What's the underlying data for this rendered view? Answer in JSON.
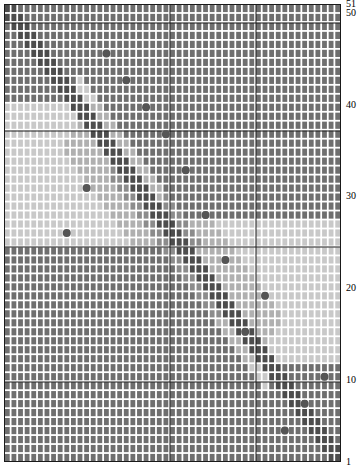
{
  "chart_data": {
    "type": "heatmap",
    "title": "",
    "xlabel": "",
    "ylabel": "",
    "n_rows": 51,
    "n_cols": 51,
    "xlim": [
      1,
      51
    ],
    "ylim": [
      1,
      51
    ],
    "grid": true,
    "legend": null,
    "axis_right": {
      "position": "right",
      "tick_labels": [
        "51",
        "50",
        "40",
        "30",
        "20",
        "10",
        "1"
      ],
      "tick_values": [
        51,
        50,
        40,
        30,
        20,
        10,
        1
      ]
    },
    "colors": {
      "dark": "#4d4d4d",
      "mid_dark": "#6f6f6f",
      "mid": "#8c8c8c",
      "mid_light": "#b0b0b0",
      "light": "#c9c9c9",
      "very_light": "#dcdcdc",
      "gridline": "#ffffff",
      "gridline_dark": "#bdbdbd",
      "marker": "#555555",
      "major_gridline": "#1a1a1a",
      "background": "#ffffff"
    },
    "major_gridlines": {
      "vertical_at_cols": [
        26,
        39
      ],
      "horizontal_at_rows": [
        10,
        25,
        38,
        50
      ]
    },
    "markers": {
      "shape": "circle",
      "radius_px": 4,
      "color": "#555555",
      "points": [
        {
          "col": 49,
          "row": 10
        },
        {
          "col": 46,
          "row": 7
        },
        {
          "col": 43,
          "row": 4
        },
        {
          "col": 40,
          "row": 19
        },
        {
          "col": 37,
          "row": 15
        },
        {
          "col": 34,
          "row": 23
        },
        {
          "col": 31,
          "row": 28
        },
        {
          "col": 28,
          "row": 33
        },
        {
          "col": 25,
          "row": 37
        },
        {
          "col": 22,
          "row": 40
        },
        {
          "col": 19,
          "row": 43
        },
        {
          "col": 16,
          "row": 46
        },
        {
          "col": 13,
          "row": 31
        },
        {
          "col": 10,
          "row": 26
        }
      ]
    }
  },
  "plot": {
    "cell_size_px": 6.608,
    "row_pitch_px": 8.98,
    "origin": {
      "left_px": 4,
      "top_px": 4
    }
  }
}
